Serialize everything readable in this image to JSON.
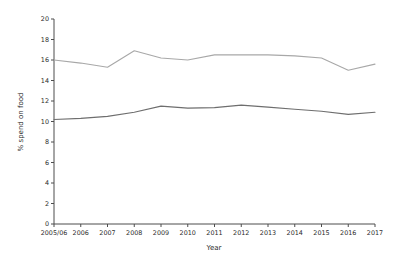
{
  "chart_data": {
    "type": "line",
    "title": "",
    "xlabel": "Year",
    "ylabel": "% spend on food",
    "categories": [
      "2005/06",
      "2006",
      "2007",
      "2008",
      "2009",
      "2010",
      "2011",
      "2012",
      "2013",
      "2014",
      "2015",
      "2016",
      "2017"
    ],
    "ylim": [
      0,
      20
    ],
    "yticks": [
      0,
      2,
      4,
      6,
      8,
      10,
      12,
      14,
      16,
      18,
      20
    ],
    "grid": false,
    "legend": "none",
    "series": [
      {
        "name": "upper-series",
        "color": "#a8a8a8",
        "values": [
          16.0,
          15.7,
          15.3,
          16.9,
          16.2,
          16.0,
          16.5,
          16.5,
          16.5,
          16.4,
          16.2,
          15.0,
          15.6
        ]
      },
      {
        "name": "lower-series",
        "color": "#6e6e6e",
        "values": [
          10.2,
          10.3,
          10.5,
          10.9,
          11.5,
          11.3,
          11.35,
          11.6,
          11.4,
          11.2,
          11.0,
          10.7,
          10.9
        ]
      }
    ]
  },
  "axis": {
    "y_label": "% spend on food",
    "x_label": "Year",
    "y_tick_labels": [
      "0",
      "2",
      "4",
      "6",
      "8",
      "10",
      "12",
      "14",
      "16",
      "18",
      "20"
    ],
    "x_tick_labels": [
      "2005/06",
      "2006",
      "2007",
      "2008",
      "2009",
      "2010",
      "2011",
      "2012",
      "2013",
      "2014",
      "2015",
      "2016",
      "2017"
    ]
  }
}
